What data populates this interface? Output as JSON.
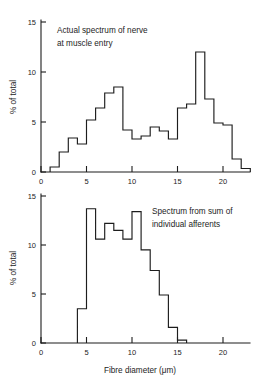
{
  "figure": {
    "background": "#ffffff",
    "ink_color": "#1d1d1d"
  },
  "chart_data": [
    {
      "type": "bar",
      "id": "top",
      "title": "",
      "annotation": [
        "Actual spectrum of nerve",
        "at muscle entry"
      ],
      "xlabel": "",
      "ylabel": "% of total",
      "xlim": [
        0,
        23
      ],
      "ylim": [
        0,
        16
      ],
      "xticks": [
        0,
        5,
        10,
        15,
        20
      ],
      "yticks": [
        0,
        5,
        10,
        15
      ],
      "xticklabels": [
        "0",
        "5",
        "10",
        "15",
        "20"
      ],
      "yticklabels": [
        "0",
        "5",
        "10",
        "15"
      ],
      "grid": false,
      "legend": "none",
      "bin_width": 1,
      "bin_edges": [
        1,
        2,
        3,
        4,
        5,
        6,
        7,
        8,
        9,
        10,
        11,
        12,
        13,
        14,
        15,
        16,
        17,
        18,
        19,
        20,
        21,
        22,
        23
      ],
      "categories": [
        "1-2",
        "2-3",
        "3-4",
        "4-5",
        "5-6",
        "6-7",
        "7-8",
        "8-9",
        "9-10",
        "10-11",
        "11-12",
        "12-13",
        "13-14",
        "14-15",
        "15-16",
        "16-17",
        "17-18",
        "18-19",
        "19-20",
        "20-21",
        "21-22",
        "22-23"
      ],
      "values": [
        0.5,
        2.0,
        3.4,
        2.8,
        5.2,
        6.4,
        7.9,
        8.5,
        4.2,
        3.3,
        3.6,
        4.5,
        4.1,
        3.3,
        6.4,
        6.8,
        12.0,
        7.3,
        4.9,
        4.7,
        1.3,
        0.35
      ]
    },
    {
      "type": "bar",
      "id": "bottom",
      "title": "",
      "annotation": [
        "Spectrum from sum of",
        "individual afferents"
      ],
      "xlabel": "Fibre diameter (μm)",
      "ylabel": "% of total",
      "xlim": [
        0,
        23
      ],
      "ylim": [
        0,
        16
      ],
      "xticks": [
        0,
        5,
        10,
        15,
        20
      ],
      "yticks": [
        0,
        5,
        10,
        15
      ],
      "xticklabels": [
        "0",
        "5",
        "10",
        "15",
        "20"
      ],
      "yticklabels": [
        "0",
        "5",
        "10",
        "15"
      ],
      "grid": false,
      "legend": "none",
      "bin_width": 1,
      "bin_edges": [
        4,
        5,
        6,
        7,
        8,
        9,
        10,
        11,
        12,
        13,
        14,
        15,
        16
      ],
      "categories": [
        "4-5",
        "5-6",
        "6-7",
        "7-8",
        "8-9",
        "9-10",
        "10-11",
        "11-12",
        "12-13",
        "13-14",
        "14-15",
        "15-16"
      ],
      "values": [
        3.5,
        13.7,
        10.6,
        12.2,
        11.5,
        10.6,
        13.4,
        9.5,
        7.4,
        4.9,
        1.6,
        0.3
      ]
    }
  ]
}
